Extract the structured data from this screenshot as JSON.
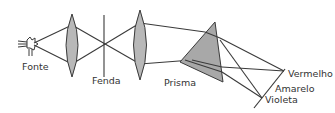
{
  "diagram": {
    "title": "",
    "labels": {
      "source": "Fonte",
      "slit": "Fenda",
      "prism": "Prisma",
      "red": "Vermelho",
      "yellow": "Amarelo",
      "violet": "Violeta"
    },
    "colors": {
      "line": "#3a3a3a",
      "lens_fill": "#b8b8b8",
      "prism_fill": "#a8a8a8",
      "text": "#333333",
      "background": "#ffffff"
    },
    "elements": [
      {
        "id": "source",
        "label": "Fonte"
      },
      {
        "id": "lens-1",
        "label": ""
      },
      {
        "id": "slit",
        "label": "Fenda"
      },
      {
        "id": "lens-2",
        "label": ""
      },
      {
        "id": "prism",
        "label": "Prisma"
      },
      {
        "id": "screen",
        "label": ""
      }
    ],
    "spectrum_labels": [
      "Vermelho",
      "Amarelo",
      "Violeta"
    ]
  }
}
